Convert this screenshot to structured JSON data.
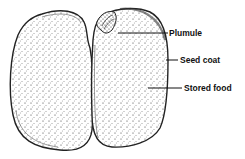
{
  "diagram": {
    "labels": [
      {
        "id": "plumule",
        "text": "Plumule"
      },
      {
        "id": "seed_coat",
        "text": "Seed coat"
      },
      {
        "id": "stored_food",
        "text": "Stored food"
      }
    ]
  }
}
